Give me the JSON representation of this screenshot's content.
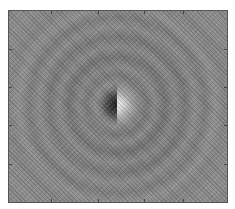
{
  "figure": {
    "type": "2D intensity map (concentric rings, split center)",
    "colormap": "grayscale",
    "background_color": "#8a8a8a",
    "center_left_color": "#1e1e1e",
    "center_right_color": "#f2f2f2",
    "frame_color": "#555555",
    "x_ticks_count": 4,
    "y_ticks_count": 4,
    "caption": ""
  }
}
